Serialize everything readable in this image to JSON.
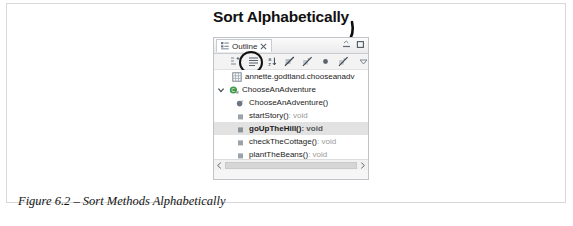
{
  "annotation": {
    "heading": "Sort Alphabetically",
    "arrow_icon": "curved-arrow-icon",
    "highlight_icon": "circle-highlight"
  },
  "outline_view": {
    "tab": {
      "icon": "outline-icon",
      "label": "Outline",
      "close_icon": "close-icon"
    },
    "window_buttons": [
      {
        "name": "minimize-button",
        "icon": "minimize-icon"
      },
      {
        "name": "maximize-button",
        "icon": "maximize-icon"
      }
    ],
    "toolbar": {
      "items": [
        {
          "name": "collapse-all-button",
          "icon": "collapse-all-icon"
        },
        {
          "name": "focus-on-active-task-button",
          "icon": "focus-task-icon"
        },
        {
          "name": "sort-alphabetically-button",
          "icon": "sort-alphabetically-icon"
        },
        {
          "name": "hide-fields-button",
          "icon": "hide-fields-icon"
        },
        {
          "name": "hide-static-fields-button",
          "icon": "hide-static-icon"
        },
        {
          "name": "hide-non-public-button",
          "icon": "hide-non-public-icon"
        },
        {
          "name": "hide-local-types-button",
          "icon": "hide-local-types-icon"
        },
        {
          "name": "view-menu-button",
          "icon": "chevron-down-icon"
        }
      ]
    },
    "tree": [
      {
        "label": "annette.godtland.chooseanadv",
        "icon": "package-icon",
        "twisty": "",
        "indent": 8,
        "selected": false,
        "return_type": ""
      },
      {
        "label": "ChooseAnAdventure",
        "icon": "class-icon",
        "twisty": "expanded",
        "indent": 0,
        "selected": false,
        "return_type": ""
      },
      {
        "label": "ChooseAnAdventure()",
        "icon": "public-constructor-icon",
        "twisty": "",
        "indent": 20,
        "selected": false,
        "return_type": ""
      },
      {
        "label": "startStory()",
        "icon": "private-method-icon",
        "twisty": "",
        "indent": 20,
        "selected": false,
        "return_type": " : void"
      },
      {
        "label": "goUpTheHill()",
        "icon": "private-method-icon",
        "twisty": "",
        "indent": 20,
        "selected": true,
        "return_type": " : void"
      },
      {
        "label": "checkTheCottage()",
        "icon": "private-method-icon",
        "twisty": "",
        "indent": 20,
        "selected": false,
        "return_type": " : void"
      },
      {
        "label": "plantTheBeans()",
        "icon": "private-method-icon",
        "twisty": "",
        "indent": 20,
        "selected": false,
        "return_type": " : void"
      },
      {
        "label": "main(String[])",
        "icon": "public-static-method-icon",
        "twisty": "",
        "indent": 20,
        "selected": false,
        "return_type": " : void"
      }
    ],
    "scrollbar": {
      "left_arrow_icon": "chevron-left-icon",
      "right_arrow_icon": "chevron-right-icon"
    }
  },
  "caption": "Figure 6.2 – Sort Methods Alphabetically"
}
